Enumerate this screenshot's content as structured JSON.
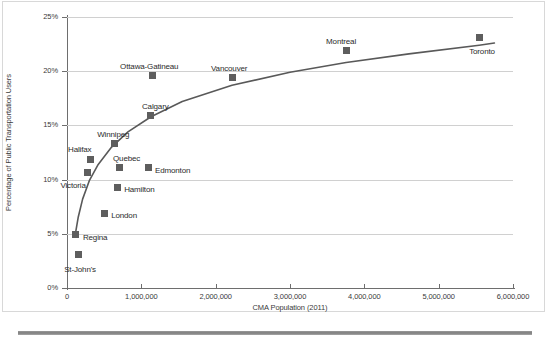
{
  "chart_data": {
    "type": "scatter",
    "title": "",
    "xlabel": "CMA Population (2011)",
    "ylabel": "Percentage of Public Transportation Users",
    "xlim": [
      0,
      6000000
    ],
    "ylim": [
      0,
      25
    ],
    "grid": true,
    "legend": false,
    "xticks": [
      {
        "value": 0,
        "label": "0"
      },
      {
        "value": 1000000,
        "label": "1,000,000"
      },
      {
        "value": 2000000,
        "label": "2,000,000"
      },
      {
        "value": 3000000,
        "label": "3,000,000"
      },
      {
        "value": 4000000,
        "label": "4,000,000"
      },
      {
        "value": 5000000,
        "label": "5,000,000"
      },
      {
        "value": 6000000,
        "label": "6,000,000"
      }
    ],
    "yticks": [
      {
        "value": 0,
        "label": "0%"
      },
      {
        "value": 5,
        "label": "5%"
      },
      {
        "value": 10,
        "label": "10%"
      },
      {
        "value": 15,
        "label": "15%"
      },
      {
        "value": 20,
        "label": "20%"
      },
      {
        "value": 25,
        "label": "25%"
      }
    ],
    "marker_color": "#5e5e5e",
    "trendline_color": "#595959",
    "points": [
      {
        "name": "St-John's",
        "x": 150000,
        "y": 3.1,
        "label_dx": -14,
        "label_dy": 16
      },
      {
        "name": "Regina",
        "x": 120000,
        "y": 4.9,
        "label_dx": 7,
        "label_dy": 3
      },
      {
        "name": "London",
        "x": 500000,
        "y": 6.9,
        "label_dx": 7,
        "label_dy": 3
      },
      {
        "name": "Victoria",
        "x": 275000,
        "y": 10.7,
        "label_dx": -27,
        "label_dy": 14
      },
      {
        "name": "Hamilton",
        "x": 675000,
        "y": 9.3,
        "label_dx": 7,
        "label_dy": 3
      },
      {
        "name": "Halifax",
        "x": 310000,
        "y": 11.9,
        "label_dx": -22,
        "label_dy": -9
      },
      {
        "name": "Quebec",
        "x": 700000,
        "y": 11.1,
        "label_dx": -6,
        "label_dy": -9
      },
      {
        "name": "Edmonton",
        "x": 1090000,
        "y": 11.1,
        "label_dx": 7,
        "label_dy": 3
      },
      {
        "name": "Winnipeg",
        "x": 635000,
        "y": 13.3,
        "label_dx": -17,
        "label_dy": -9
      },
      {
        "name": "Calgary",
        "x": 1130000,
        "y": 15.9,
        "label_dx": -9,
        "label_dy": -9
      },
      {
        "name": "Ottawa-Gatineau",
        "x": 1145000,
        "y": 19.6,
        "label_dx": -32,
        "label_dy": -9
      },
      {
        "name": "Vancouver",
        "x": 2220000,
        "y": 19.4,
        "label_dx": -21,
        "label_dy": -9
      },
      {
        "name": "Montreal",
        "x": 3755000,
        "y": 21.9,
        "label_dx": -20,
        "label_dy": -9
      },
      {
        "name": "Toronto",
        "x": 5545000,
        "y": 23.1,
        "label_dx": -10,
        "label_dy": 14
      }
    ],
    "trendline": {
      "description": "logarithmic best-fit curve",
      "points": [
        {
          "x": 105000,
          "y": 4.7
        },
        {
          "x": 150000,
          "y": 6.5
        },
        {
          "x": 210000,
          "y": 8.2
        },
        {
          "x": 300000,
          "y": 9.9
        },
        {
          "x": 420000,
          "y": 11.4
        },
        {
          "x": 600000,
          "y": 13.0
        },
        {
          "x": 820000,
          "y": 14.4
        },
        {
          "x": 1130000,
          "y": 15.8
        },
        {
          "x": 1550000,
          "y": 17.2
        },
        {
          "x": 2220000,
          "y": 18.7
        },
        {
          "x": 3000000,
          "y": 19.9
        },
        {
          "x": 3755000,
          "y": 20.8
        },
        {
          "x": 4600000,
          "y": 21.6
        },
        {
          "x": 5545000,
          "y": 22.4
        },
        {
          "x": 5750000,
          "y": 22.6
        }
      ]
    }
  }
}
